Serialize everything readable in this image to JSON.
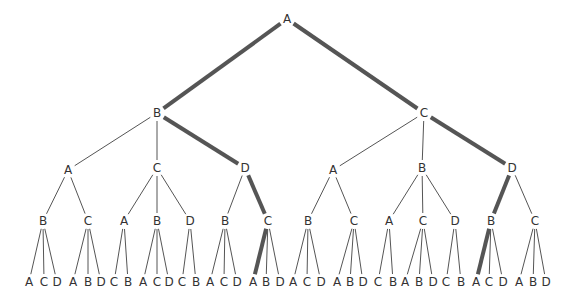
{
  "diagram": {
    "type": "tree",
    "edge_color": "#555555",
    "label_color": "#333333",
    "highlighted_paths": [
      [
        "A",
        "B",
        "D",
        "C",
        "A"
      ],
      [
        "A",
        "C",
        "D",
        "B",
        "A"
      ]
    ],
    "root": {
      "label": "A",
      "x": 287,
      "y": 19,
      "children": [
        {
          "label": "B",
          "x": 157,
          "y": 113,
          "hl": true,
          "children": [
            {
              "label": "A",
              "x": 68,
              "y": 170,
              "children": [
                {
                  "label": "B",
                  "x": 43,
                  "y": 221,
                  "children": [
                    {
                      "label": "A",
                      "x": 29,
                      "y": 282
                    },
                    {
                      "label": "C",
                      "x": 44,
                      "y": 282
                    },
                    {
                      "label": "D",
                      "x": 57,
                      "y": 282
                    }
                  ]
                },
                {
                  "label": "C",
                  "x": 88,
                  "y": 221,
                  "children": [
                    {
                      "label": "A",
                      "x": 73,
                      "y": 282
                    },
                    {
                      "label": "B",
                      "x": 88,
                      "y": 282
                    },
                    {
                      "label": "D",
                      "x": 101,
                      "y": 282
                    }
                  ]
                }
              ]
            },
            {
              "label": "C",
              "x": 157,
              "y": 168,
              "children": [
                {
                  "label": "A",
                  "x": 124,
                  "y": 221,
                  "children": [
                    {
                      "label": "C",
                      "x": 114,
                      "y": 282
                    },
                    {
                      "label": "B",
                      "x": 128,
                      "y": 282
                    }
                  ]
                },
                {
                  "label": "B",
                  "x": 157,
                  "y": 221,
                  "children": [
                    {
                      "label": "A",
                      "x": 143,
                      "y": 282
                    },
                    {
                      "label": "C",
                      "x": 157,
                      "y": 282
                    },
                    {
                      "label": "D",
                      "x": 169,
                      "y": 282
                    }
                  ]
                },
                {
                  "label": "D",
                  "x": 190,
                  "y": 221,
                  "children": [
                    {
                      "label": "C",
                      "x": 182,
                      "y": 282
                    },
                    {
                      "label": "B",
                      "x": 196,
                      "y": 282
                    }
                  ]
                }
              ]
            },
            {
              "label": "D",
              "x": 245,
              "y": 168,
              "hl": true,
              "children": [
                {
                  "label": "B",
                  "x": 225,
                  "y": 221,
                  "children": [
                    {
                      "label": "A",
                      "x": 210,
                      "y": 282
                    },
                    {
                      "label": "C",
                      "x": 224,
                      "y": 282
                    },
                    {
                      "label": "D",
                      "x": 237,
                      "y": 282
                    }
                  ]
                },
                {
                  "label": "C",
                  "x": 268,
                  "y": 221,
                  "hl": true,
                  "children": [
                    {
                      "label": "A",
                      "x": 253,
                      "y": 282,
                      "hl": true
                    },
                    {
                      "label": "B",
                      "x": 266,
                      "y": 282
                    },
                    {
                      "label": "D",
                      "x": 280,
                      "y": 282
                    }
                  ]
                }
              ]
            }
          ]
        },
        {
          "label": "C",
          "x": 424,
          "y": 113,
          "hl": true,
          "children": [
            {
              "label": "A",
              "x": 333,
              "y": 170,
              "children": [
                {
                  "label": "B",
                  "x": 308,
                  "y": 221,
                  "children": [
                    {
                      "label": "A",
                      "x": 293,
                      "y": 282
                    },
                    {
                      "label": "C",
                      "x": 307,
                      "y": 282
                    },
                    {
                      "label": "D",
                      "x": 321,
                      "y": 282
                    }
                  ]
                },
                {
                  "label": "C",
                  "x": 354,
                  "y": 221,
                  "children": [
                    {
                      "label": "A",
                      "x": 337,
                      "y": 282
                    },
                    {
                      "label": "B",
                      "x": 350,
                      "y": 282
                    },
                    {
                      "label": "D",
                      "x": 363,
                      "y": 282
                    }
                  ]
                }
              ]
            },
            {
              "label": "B",
              "x": 422,
              "y": 168,
              "children": [
                {
                  "label": "A",
                  "x": 389,
                  "y": 221,
                  "children": [
                    {
                      "label": "C",
                      "x": 378,
                      "y": 282
                    },
                    {
                      "label": "B",
                      "x": 393,
                      "y": 282
                    }
                  ]
                },
                {
                  "label": "C",
                  "x": 423,
                  "y": 221,
                  "children": [
                    {
                      "label": "A",
                      "x": 405,
                      "y": 282
                    },
                    {
                      "label": "B",
                      "x": 419,
                      "y": 282
                    },
                    {
                      "label": "D",
                      "x": 433,
                      "y": 282
                    }
                  ]
                },
                {
                  "label": "D",
                  "x": 455,
                  "y": 221,
                  "children": [
                    {
                      "label": "C",
                      "x": 446,
                      "y": 282
                    },
                    {
                      "label": "B",
                      "x": 461,
                      "y": 282
                    }
                  ]
                }
              ]
            },
            {
              "label": "D",
              "x": 512,
              "y": 168,
              "hl": true,
              "children": [
                {
                  "label": "B",
                  "x": 491,
                  "y": 221,
                  "hl": true,
                  "children": [
                    {
                      "label": "A",
                      "x": 476,
                      "y": 282,
                      "hl": true
                    },
                    {
                      "label": "C",
                      "x": 489,
                      "y": 282
                    },
                    {
                      "label": "D",
                      "x": 503,
                      "y": 282
                    }
                  ]
                },
                {
                  "label": "C",
                  "x": 535,
                  "y": 221,
                  "children": [
                    {
                      "label": "A",
                      "x": 519,
                      "y": 282
                    },
                    {
                      "label": "B",
                      "x": 533,
                      "y": 282
                    },
                    {
                      "label": "D",
                      "x": 546,
                      "y": 282
                    }
                  ]
                }
              ]
            }
          ]
        }
      ]
    }
  }
}
